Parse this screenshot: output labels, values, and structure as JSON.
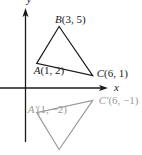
{
  "diagram": {
    "type": "coordinate-plane-reflection",
    "axes": {
      "x_label": "x",
      "y_label": "y",
      "color": "#1a1a1a"
    },
    "triangles": [
      {
        "name": "original",
        "color": "#1a1a1a",
        "vertices": [
          {
            "id": "A",
            "label": "A(1, 2)",
            "x": 1,
            "y": 2
          },
          {
            "id": "B",
            "label": "B(3, 5)",
            "x": 3,
            "y": 5
          },
          {
            "id": "C",
            "label": "C(6, 1)",
            "x": 6,
            "y": 1
          }
        ]
      },
      {
        "name": "reflected",
        "color": "#9a9a9a",
        "vertices": [
          {
            "id": "A'",
            "label": "A′(1, −2)",
            "x": 1,
            "y": -2
          },
          {
            "id": "B'",
            "label": "B′(3, −5)",
            "x": 3,
            "y": -5
          },
          {
            "id": "C'",
            "label": "C′(6, −1)",
            "x": 6,
            "y": -1
          }
        ]
      }
    ]
  }
}
